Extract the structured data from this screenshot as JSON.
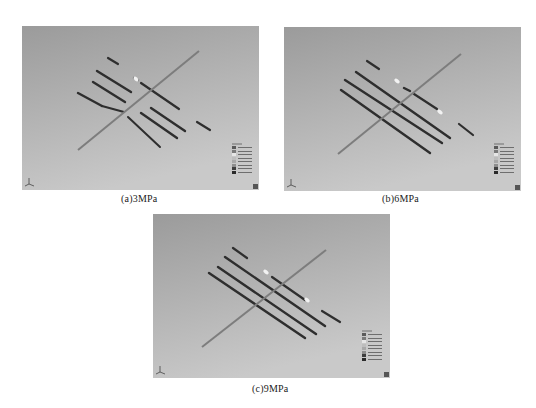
{
  "figure": {
    "background": "#ffffff",
    "panels": [
      {
        "id": "a",
        "caption": "(a)3MPa",
        "pressure": "3MPa",
        "box": {
          "x": 22,
          "y": 26,
          "w": 237,
          "h": 164
        },
        "caption_pos": {
          "x": 121,
          "y": 193
        },
        "wellbore": {
          "x1": 78,
          "y1": 150,
          "x2": 199,
          "y2": 51
        },
        "fractures": [
          {
            "x1": 108,
            "y1": 58,
            "x2": 118,
            "y2": 64,
            "w": 2.2
          },
          {
            "x1": 134,
            "y1": 78,
            "x2": 138,
            "y2": 80,
            "w": 2.2
          },
          {
            "x1": 141,
            "y1": 83,
            "x2": 179,
            "y2": 109,
            "w": 2.2
          },
          {
            "x1": 197,
            "y1": 122,
            "x2": 210,
            "y2": 130,
            "w": 2.2
          },
          {
            "x1": 97,
            "y1": 71,
            "x2": 131,
            "y2": 92,
            "w": 2.4
          },
          {
            "x1": 151,
            "y1": 108,
            "x2": 185,
            "y2": 131,
            "w": 2.4
          },
          {
            "x1": 93,
            "y1": 82,
            "x2": 125,
            "y2": 102,
            "w": 2.4
          },
          {
            "x1": 141,
            "y1": 113,
            "x2": 177,
            "y2": 138,
            "w": 2.4
          },
          {
            "x1": 78,
            "y1": 93,
            "x2": 102,
            "y2": 106,
            "w": 2.4
          },
          {
            "x1": 102,
            "y1": 106,
            "x2": 124,
            "y2": 112,
            "w": 2.2
          },
          {
            "x1": 128,
            "y1": 117,
            "x2": 160,
            "y2": 147,
            "w": 2.0
          }
        ],
        "highlights": [
          {
            "x": 136,
            "y": 79
          }
        ],
        "legend": {
          "x": 232,
          "y": 143
        }
      },
      {
        "id": "b",
        "caption": "(b)6MPa",
        "pressure": "6MPa",
        "box": {
          "x": 284,
          "y": 27,
          "w": 237,
          "h": 164
        },
        "caption_pos": {
          "x": 382,
          "y": 193
        },
        "wellbore": {
          "x1": 338,
          "y1": 154,
          "x2": 461,
          "y2": 54
        },
        "fractures": [
          {
            "x1": 367,
            "y1": 61,
            "x2": 379,
            "y2": 69,
            "w": 2.2
          },
          {
            "x1": 404,
            "y1": 88,
            "x2": 410,
            "y2": 91,
            "w": 2.4
          },
          {
            "x1": 414,
            "y1": 94,
            "x2": 437,
            "y2": 109,
            "w": 2.2
          },
          {
            "x1": 459,
            "y1": 124,
            "x2": 473,
            "y2": 135,
            "w": 2.2
          },
          {
            "x1": 356,
            "y1": 72,
            "x2": 450,
            "y2": 138,
            "w": 2.4
          },
          {
            "x1": 345,
            "y1": 80,
            "x2": 442,
            "y2": 143,
            "w": 2.4
          },
          {
            "x1": 341,
            "y1": 90,
            "x2": 430,
            "y2": 153,
            "w": 2.4
          }
        ],
        "highlights": [
          {
            "x": 397,
            "y": 81
          },
          {
            "x": 440,
            "y": 112
          }
        ],
        "legend": {
          "x": 494,
          "y": 143
        }
      },
      {
        "id": "c",
        "caption": "(c)9MPa",
        "pressure": "9MPa",
        "box": {
          "x": 153,
          "y": 214,
          "w": 237,
          "h": 164
        },
        "caption_pos": {
          "x": 252,
          "y": 383
        },
        "wellbore": {
          "x1": 202,
          "y1": 347,
          "x2": 326,
          "y2": 250
        },
        "fractures": [
          {
            "x1": 233,
            "y1": 248,
            "x2": 247,
            "y2": 258,
            "w": 2.2
          },
          {
            "x1": 272,
            "y1": 277,
            "x2": 305,
            "y2": 300,
            "w": 2.2
          },
          {
            "x1": 322,
            "y1": 311,
            "x2": 340,
            "y2": 322,
            "w": 2.2
          },
          {
            "x1": 225,
            "y1": 257,
            "x2": 325,
            "y2": 326,
            "w": 2.4
          },
          {
            "x1": 218,
            "y1": 267,
            "x2": 316,
            "y2": 334,
            "w": 2.4
          },
          {
            "x1": 209,
            "y1": 273,
            "x2": 305,
            "y2": 338,
            "w": 2.4
          }
        ],
        "highlights": [
          {
            "x": 266,
            "y": 272
          },
          {
            "x": 307,
            "y": 300
          }
        ],
        "legend": {
          "x": 362,
          "y": 330
        }
      }
    ],
    "legend_swatches": [
      "#5a5a5a",
      "#7a7a7a",
      "#e6e6e6",
      "#bdbdbd",
      "#a8a8a8",
      "#8e8e8e",
      "#3e3e3e",
      "#2a2a2a"
    ],
    "colors": {
      "bg_top": "#9b9b9b",
      "bg_bottom": "#c9c9c9",
      "wellbore": "#7d7d7d",
      "fracture": "#2e2e2e",
      "highlight": "#f2f2f2"
    }
  }
}
